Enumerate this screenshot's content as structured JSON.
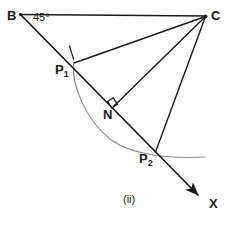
{
  "figure": {
    "caption": "(ii)",
    "angle_label": "45°",
    "stroke_color": "#1a1a1a",
    "arc_color": "#8a8a8a",
    "background_color": "#ffffff",
    "points": {
      "B": {
        "label": "B",
        "x": 20,
        "y": 14
      },
      "C": {
        "label": "C",
        "x": 206,
        "y": 16
      },
      "P1": {
        "label": "P",
        "subscript": "1",
        "x": 73,
        "y": 63
      },
      "N": {
        "label": "N",
        "x": 113,
        "y": 107
      },
      "P2": {
        "label": "P",
        "subscript": "2",
        "x": 155,
        "y": 152
      },
      "X": {
        "label": "X",
        "x": 205,
        "y": 202
      }
    },
    "segments": [
      {
        "name": "BC",
        "from": "B",
        "to": "C"
      },
      {
        "name": "B-to-X-ray",
        "from": "B",
        "to": "X",
        "arrow": true
      },
      {
        "name": "CP1",
        "from": "C",
        "to": "P1"
      },
      {
        "name": "CN",
        "from": "C",
        "to": "N"
      },
      {
        "name": "CP2",
        "from": "C",
        "to": "P2"
      }
    ],
    "markers": {
      "right_angle_at": "N",
      "tick_mark_at": "P1"
    },
    "arc": {
      "name": "construction-arc",
      "from": "P1",
      "through": "P2",
      "ends_at_x": 205,
      "ends_at_y": 157
    }
  }
}
